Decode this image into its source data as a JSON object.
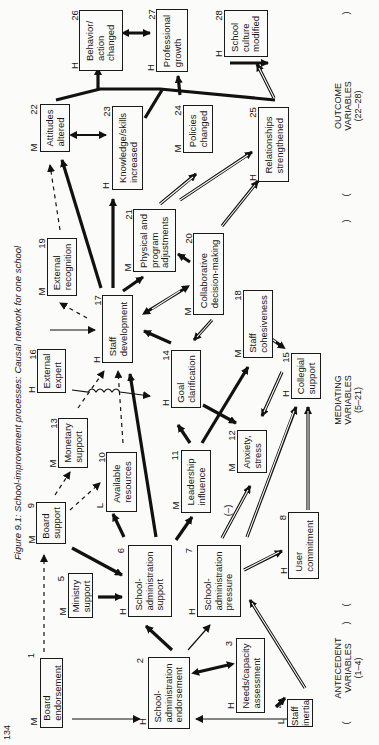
{
  "figure": {
    "caption": "Figure 9.1:   School-improvement processes: Causal network for one school",
    "page_number": "134"
  },
  "sections": [
    {
      "label": "ANTECEDENT\nVARIABLES\n(1–4)"
    },
    {
      "label": "MEDIATING\nVARIABLES\n(5–21)"
    },
    {
      "label": "OUTCOME\nVARIABLES\n(22–28)"
    }
  ],
  "nodes": [
    {
      "id": "1",
      "label": "Board\nendorsement",
      "rating": "M"
    },
    {
      "id": "2",
      "label": "School-\nadministration\nendorsement",
      "rating": "H"
    },
    {
      "id": "3",
      "label": "Needs/capacity\nassessment",
      "rating": "H"
    },
    {
      "id": "4",
      "label": "Staff\ninertia",
      "rating": "L"
    },
    {
      "id": "5",
      "label": "Ministry\nsupport",
      "rating": "M"
    },
    {
      "id": "6",
      "label": "School-\nadministration\nsupport",
      "rating": "H"
    },
    {
      "id": "7",
      "label": "School-\nadministration\npressure",
      "rating": "H"
    },
    {
      "id": "8",
      "label": "User\ncommitment",
      "rating": "H"
    },
    {
      "id": "9",
      "label": "Board\nsupport",
      "rating": "M"
    },
    {
      "id": "10",
      "label": "Available\nresources",
      "rating": "L"
    },
    {
      "id": "11",
      "label": "Leadership\ninfluence",
      "rating": "M"
    },
    {
      "id": "12",
      "label": "Anxiety,\nstress",
      "rating": "M"
    },
    {
      "id": "13",
      "label": "Monetary\nsupport",
      "rating": "M"
    },
    {
      "id": "14",
      "label": "Goal\nclarification",
      "rating": "H"
    },
    {
      "id": "15",
      "label": "Collegial\nsupport",
      "rating": "H"
    },
    {
      "id": "16",
      "label": "External\nexpert",
      "rating": "H"
    },
    {
      "id": "17",
      "label": "Staff\ndevelopment",
      "rating": "H"
    },
    {
      "id": "18",
      "label": "Staff\ncohesiveness",
      "rating": "M"
    },
    {
      "id": "19",
      "label": "External\nrecognition",
      "rating": "M"
    },
    {
      "id": "20",
      "label": "Collaborative\ndecision-making",
      "rating": "M"
    },
    {
      "id": "21",
      "label": "Physical and\nprogram\nadjustments",
      "rating": "M"
    },
    {
      "id": "22",
      "label": "Attitudes\naltered",
      "rating": "M"
    },
    {
      "id": "23",
      "label": "Knowledge/skills\nincreased",
      "rating": "H"
    },
    {
      "id": "24",
      "label": "Policies\nchanged",
      "rating": "M"
    },
    {
      "id": "25",
      "label": "Relationships\nstrengthened",
      "rating": "H"
    },
    {
      "id": "26",
      "label": "Behavior/\naction\nchanged",
      "rating": "H"
    },
    {
      "id": "27",
      "label": "Professional\ngrowth",
      "rating": "H"
    },
    {
      "id": "28",
      "label": "School\nculture\nmodified",
      "rating": "H"
    }
  ],
  "annotations": {
    "negative_link": "(–)"
  },
  "legend_styles": {
    "strong": "thick solid arrow",
    "moderate": "thin solid arrow",
    "weak": "dashed arrow",
    "double": "double-line arrow"
  }
}
